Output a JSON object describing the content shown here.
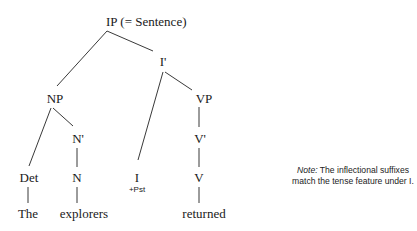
{
  "tree": {
    "nodes": {
      "ip": "IP (= Sentence)",
      "ibar": "I'",
      "np": "NP",
      "vp": "VP",
      "nbar": "N'",
      "vbar": "V'",
      "det": "Det",
      "n": "N",
      "i": "I",
      "i_feature": "+Pst",
      "v": "V",
      "word_the": "The",
      "word_explorers": "explorers",
      "word_returned": "returned"
    }
  },
  "note": {
    "label": "Note:",
    "text": "The inflectional suffixes match the tense feature under I."
  }
}
